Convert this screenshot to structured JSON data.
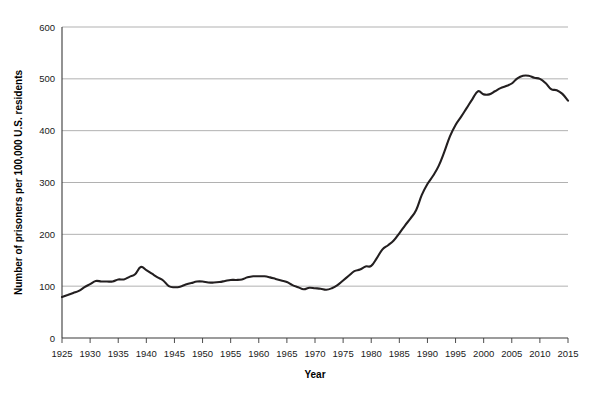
{
  "chart_data": {
    "type": "line",
    "title": "",
    "xlabel": "Year",
    "ylabel": "Number of prisoners per 100,000 U.S. residents",
    "xlim": [
      1925,
      2015
    ],
    "ylim": [
      0,
      600
    ],
    "grid": true,
    "legend": false,
    "legend_position": "none",
    "line_color": "#231f20",
    "gridline_color": "#8f8f8f",
    "background_color": "#ffffff",
    "xticks": [
      1925,
      1930,
      1935,
      1940,
      1945,
      1950,
      1955,
      1960,
      1965,
      1970,
      1975,
      1980,
      1985,
      1990,
      1995,
      2000,
      2005,
      2010,
      2015
    ],
    "xtick_labels": [
      "1925",
      "1930",
      "1935",
      "1940",
      "1945",
      "1950",
      "1955",
      "1960",
      "1965",
      "1970",
      "1975",
      "1980",
      "1985",
      "1990",
      "1995",
      "2000",
      "2005",
      "2010",
      "2015"
    ],
    "yticks": [
      0,
      100,
      200,
      300,
      400,
      500,
      600
    ],
    "ytick_labels": [
      "0",
      "100",
      "200",
      "300",
      "400",
      "500",
      "600"
    ],
    "series": [
      {
        "name": "Imprisonment rate",
        "x": [
          1925,
          1926,
          1927,
          1928,
          1929,
          1930,
          1931,
          1932,
          1933,
          1934,
          1935,
          1936,
          1937,
          1938,
          1939,
          1940,
          1941,
          1942,
          1943,
          1944,
          1945,
          1946,
          1947,
          1948,
          1949,
          1950,
          1951,
          1952,
          1953,
          1954,
          1955,
          1956,
          1957,
          1958,
          1959,
          1960,
          1961,
          1962,
          1963,
          1964,
          1965,
          1966,
          1967,
          1968,
          1969,
          1970,
          1971,
          1972,
          1973,
          1974,
          1975,
          1976,
          1977,
          1978,
          1979,
          1980,
          1981,
          1982,
          1983,
          1984,
          1985,
          1986,
          1987,
          1988,
          1989,
          1990,
          1991,
          1992,
          1993,
          1994,
          1995,
          1996,
          1997,
          1998,
          1999,
          2000,
          2001,
          2002,
          2003,
          2004,
          2005,
          2006,
          2007,
          2008,
          2009,
          2010,
          2011,
          2012,
          2013,
          2014,
          2015
        ],
        "values": [
          79,
          83,
          87,
          91,
          98,
          104,
          110,
          109,
          109,
          109,
          113,
          113,
          118,
          123,
          137,
          131,
          124,
          117,
          111,
          100,
          98,
          99,
          103,
          106,
          109,
          109,
          107,
          107,
          108,
          110,
          112,
          112,
          113,
          117,
          119,
          119,
          119,
          117,
          114,
          111,
          108,
          102,
          98,
          94,
          97,
          96,
          95,
          93,
          96,
          102,
          111,
          120,
          129,
          132,
          138,
          139,
          154,
          171,
          179,
          188,
          202,
          217,
          231,
          247,
          276,
          297,
          313,
          332,
          359,
          389,
          411,
          427,
          444,
          461,
          476,
          470,
          470,
          476,
          482,
          486,
          491,
          501,
          506,
          506,
          502,
          500,
          492,
          480,
          478,
          471,
          458
        ]
      }
    ],
    "annotations": []
  },
  "figure": {
    "plot_left": 62,
    "plot_right": 568,
    "plot_top": 27,
    "plot_bottom": 338
  }
}
